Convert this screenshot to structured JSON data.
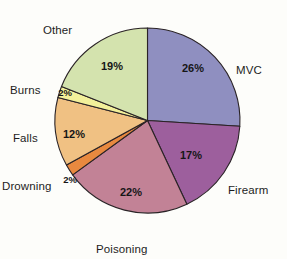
{
  "chart_data": {
    "type": "pie",
    "title": "",
    "subtitle": "",
    "xlabel": "",
    "ylabel": "",
    "legend_position": "none",
    "grid": false,
    "start_angle_deg": 0,
    "direction": "clockwise",
    "categories": [
      "MVC",
      "Firearm",
      "Poisoning",
      "Drowning",
      "Falls",
      "Burns",
      "Other"
    ],
    "values": [
      26,
      17,
      22,
      2,
      12,
      2,
      19
    ],
    "value_labels": [
      "26%",
      "17%",
      "22%",
      "2%",
      "12%",
      "2%",
      "19%"
    ],
    "colors": [
      "#8f8fc0",
      "#9d5f9d",
      "#c28296",
      "#e8893f",
      "#f0c183",
      "#f2f09a",
      "#d4e3ae"
    ],
    "slices": [
      {
        "name": "MVC",
        "value": 26,
        "label": "26%",
        "color": "#8f8fc0",
        "label_x": 193,
        "label_y": 72,
        "cat_x": 236,
        "cat_y": 64
      },
      {
        "name": "Firearm",
        "value": 17,
        "label": "17%",
        "color": "#9d5f9d",
        "label_x": 191,
        "label_y": 159,
        "cat_x": 228,
        "cat_y": 184
      },
      {
        "name": "Poisoning",
        "value": 22,
        "label": "22%",
        "color": "#c28296",
        "label_x": 131,
        "label_y": 196,
        "cat_x": 96,
        "cat_y": 243
      },
      {
        "name": "Drowning",
        "value": 2,
        "label": "2%",
        "color": "#e8893f",
        "label_x": 70,
        "label_y": 183,
        "cat_x": 2,
        "cat_y": 180
      },
      {
        "name": "Falls",
        "value": 12,
        "label": "12%",
        "color": "#f0c183",
        "label_x": 74,
        "label_y": 138,
        "cat_x": 13,
        "cat_y": 132
      },
      {
        "name": "Burns",
        "value": 2,
        "label": "2%",
        "color": "#f2f09a",
        "label_x": 65,
        "label_y": 96,
        "cat_x": 10,
        "cat_y": 84
      },
      {
        "name": "Other",
        "value": 19,
        "label": "19%",
        "color": "#d4e3ae",
        "label_x": 112,
        "label_y": 70,
        "cat_x": 43,
        "cat_y": 24
      }
    ],
    "total": 100,
    "units": "percent",
    "stroke_color": "#2a2326",
    "background": "#fdfdfa"
  }
}
